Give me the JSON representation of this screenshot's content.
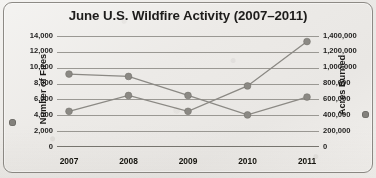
{
  "figure": {
    "title": "June U.S. Wildfire Activity (2007–2011)",
    "frame_color": "#8d8a85",
    "series_color": "#8b8984",
    "grid_color": "#9a9893"
  },
  "axes": {
    "left": {
      "label": "Number of Fires",
      "ticks": [
        "0",
        "2,000",
        "4,000",
        "6,000",
        "8,000",
        "10,000",
        "12,000",
        "14,000"
      ],
      "legend_marker": "series-dot-icon"
    },
    "right": {
      "label": "Acres Burned",
      "ticks": [
        "0",
        "200,000",
        "400,000",
        "600,000",
        "800,000",
        "1,000,000",
        "1,200,000",
        "1,400,000"
      ],
      "legend_marker": "series-dot-icon"
    },
    "bottom": {
      "ticks": [
        "2007",
        "2008",
        "2009",
        "2010",
        "2011"
      ]
    }
  },
  "chart_data": {
    "type": "line",
    "title": "June U.S. Wildfire Activity (2007–2011)",
    "xlabel": "",
    "ylabel": "Number of Fires",
    "y2label": "Acres Burned",
    "categories": [
      "2007",
      "2008",
      "2009",
      "2010",
      "2011"
    ],
    "x": [
      2007,
      2008,
      2009,
      2010,
      2011
    ],
    "grid": true,
    "legend_position": "axis-labels",
    "ylim": [
      0,
      14000
    ],
    "yticks": [
      0,
      2000,
      4000,
      6000,
      8000,
      10000,
      12000,
      14000
    ],
    "y2lim": [
      0,
      1400000
    ],
    "y2ticks": [
      0,
      200000,
      400000,
      600000,
      800000,
      1000000,
      1200000,
      1400000
    ],
    "series": [
      {
        "name": "Number of Fires",
        "axis": "left",
        "values": [
          9200,
          8900,
          6500,
          4050,
          6300
        ]
      },
      {
        "name": "Acres Burned",
        "axis": "right",
        "values": [
          450000,
          650000,
          450000,
          770000,
          1330000
        ]
      }
    ]
  }
}
